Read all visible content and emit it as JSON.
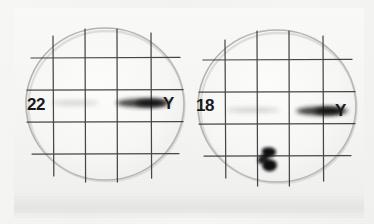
{
  "figure": {
    "background_color": "#f4f4f3",
    "ink_color": "#3a3a3a",
    "band_color": "#171717"
  },
  "plates": [
    {
      "id": "plate-left",
      "sample_label": "22",
      "axis_label": "Y",
      "center_x": 105,
      "center_y": 104,
      "radius": 79,
      "grid": {
        "vertical_lines": [
          -52,
          -20,
          12,
          46
        ],
        "horizontal_lines": [
          -46,
          -14,
          18,
          52
        ]
      },
      "bands": [
        {
          "name": "primary-band",
          "cx": 38,
          "cy": -1,
          "rx": 27,
          "ry": 4,
          "opacity": 0.92
        },
        {
          "name": "primary-band-core",
          "cx": 46,
          "cy": -1,
          "rx": 15,
          "ry": 3,
          "opacity": 0.95
        },
        {
          "name": "faint-trailing-band",
          "cx": -30,
          "cy": -1,
          "rx": 24,
          "ry": 2,
          "opacity": 0.22
        }
      ],
      "spots": []
    },
    {
      "id": "plate-right",
      "sample_label": "18",
      "axis_label": "Y",
      "center_x": 277,
      "center_y": 106,
      "radius": 79,
      "grid": {
        "vertical_lines": [
          -52,
          -20,
          12,
          46
        ],
        "horizontal_lines": [
          -46,
          -14,
          18,
          52
        ]
      },
      "bands": [
        {
          "name": "primary-band",
          "cx": 45,
          "cy": 5,
          "rx": 26,
          "ry": 4,
          "opacity": 0.93
        },
        {
          "name": "primary-band-core",
          "cx": 52,
          "cy": 5,
          "rx": 14,
          "ry": 3,
          "opacity": 0.96
        },
        {
          "name": "faint-trailing-band",
          "cx": -24,
          "cy": 4,
          "rx": 27,
          "ry": 2,
          "opacity": 0.25
        }
      ],
      "spots": [
        {
          "name": "ink-blot-mark",
          "cx": -7,
          "cy": 54,
          "r": 8,
          "opacity": 0.9
        }
      ]
    }
  ],
  "labels": {
    "left_sample": "22",
    "left_axis": "Y",
    "right_sample": "18",
    "right_axis": "Y"
  }
}
